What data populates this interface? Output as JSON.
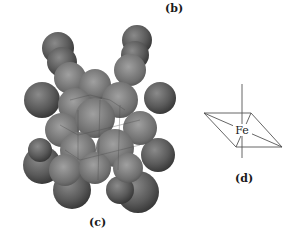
{
  "figure": {
    "panel_b_label": "(b)",
    "panel_c_label": "(c)",
    "panel_d_label": "(d)",
    "panel_c_description": "space-filling molecular model",
    "panel_d_description": "Fe atom at center of square-planar coordination plane with perpendicular axis",
    "fe_label": "Fe"
  },
  "colors": {
    "atom_dark": "#3e3e3e",
    "atom_mid": "#6a6a6a",
    "atom_light": "#9a9a9a",
    "line": "#555555",
    "background": "#ffffff"
  }
}
